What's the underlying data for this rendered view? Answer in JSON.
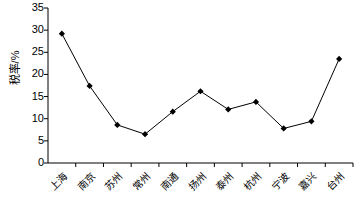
{
  "chart_data": {
    "type": "line",
    "title": "",
    "xlabel": "",
    "ylabel": "税率/%",
    "ylim": [
      0,
      35
    ],
    "ytick_step": 5,
    "yticks": [
      "0",
      "5",
      "10",
      "15",
      "20",
      "25",
      "30",
      "35"
    ],
    "grid": false,
    "legend": "none",
    "marker": "diamond",
    "marker_color": "#000000",
    "line_color": "#000000",
    "categories": [
      "上海",
      "南京",
      "苏州",
      "常州",
      "南通",
      "扬州",
      "泰州",
      "杭州",
      "宁波",
      "嘉兴",
      "台州"
    ],
    "values": [
      29.2,
      17.4,
      8.6,
      6.5,
      11.6,
      16.2,
      12.1,
      13.8,
      7.8,
      9.4,
      23.5
    ],
    "series": [
      {
        "name": "税率",
        "values": [
          29.2,
          17.4,
          8.6,
          6.5,
          11.6,
          16.2,
          12.1,
          13.8,
          7.8,
          9.4,
          23.5
        ]
      }
    ]
  },
  "axis_colors": {
    "axis_line": "#000000",
    "background": "#ffffff"
  }
}
